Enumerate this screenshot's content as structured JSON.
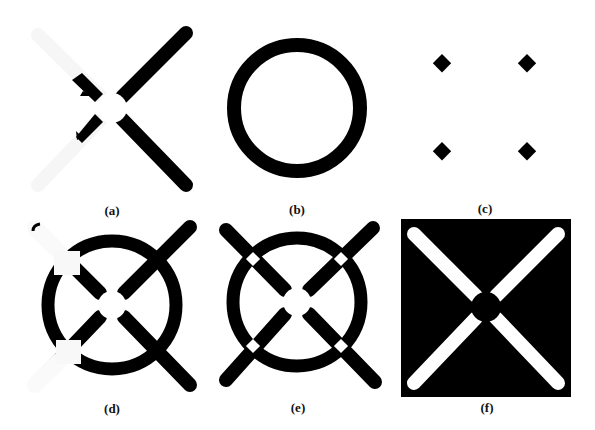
{
  "figure": {
    "colors": {
      "ink": "#000000",
      "paper": "#ffffff",
      "faint": "#f4f4f4"
    },
    "panels": [
      {
        "id": "a",
        "label": "(a)",
        "description": "X shape: right arms black, left arms faint white with small black stubs, white gap at center"
      },
      {
        "id": "b",
        "label": "(b)",
        "description": "Thick black ring"
      },
      {
        "id": "c",
        "label": "(c)",
        "description": "Four black diamonds at square corners"
      },
      {
        "id": "d",
        "label": "(d)",
        "description": "Ring with X: right arms black, left arms faint with white square patches"
      },
      {
        "id": "e",
        "label": "(e)",
        "description": "Ring with full black X, white gaps at crossings and center"
      },
      {
        "id": "f",
        "label": "(f)",
        "description": "Black square with white X and black center disc"
      }
    ]
  }
}
